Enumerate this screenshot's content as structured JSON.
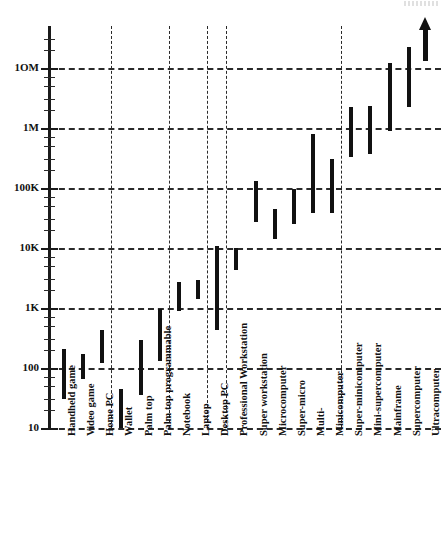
{
  "chart_data": {
    "type": "bar",
    "chart_style": "floating range bars (high-low) on logarithmic scale",
    "title": "",
    "subtitle": "",
    "xlabel": "",
    "ylabel": "",
    "grid": true,
    "legend": null,
    "y_axis": {
      "scale": "log10",
      "tick_labels": [
        "10",
        "100",
        "1K",
        "10K",
        "100K",
        "1M",
        "1OM"
      ],
      "tick_values": [
        10,
        100,
        1000,
        10000,
        100000,
        1000000,
        10000000
      ],
      "ylim": [
        10,
        30000000
      ],
      "minor_ticks_per_decade": 4
    },
    "x_axis": {
      "vertical_gridline_after": [
        "Home PC",
        "Palm top programmable",
        "Laptop",
        "Desktop PC",
        "Minicomputer"
      ]
    },
    "categories": [
      "Handheld game",
      "Video game",
      "Home PC",
      "Wallet",
      "Palm top",
      "Palm top programmable",
      "Notebook",
      "Laptop",
      "Desktop PC",
      "Professional Workstation",
      "Super workstation",
      "Microcomputer",
      "Super-micro",
      "Multi-",
      "Minicomputer",
      "Super-minicomputer",
      "Mini-supercomputer",
      "Mainframe",
      "Supercomputer",
      "Ultracomputer"
    ],
    "bars_low": [
      30,
      65,
      120,
      10,
      35,
      130,
      900,
      1400,
      430,
      4300,
      27000,
      14000,
      25000,
      38000,
      38000,
      330000,
      370000,
      900000,
      2200000
    ],
    "bars_high": [
      210,
      170,
      430,
      45,
      290,
      950,
      2700,
      2900,
      11000,
      10000,
      130000,
      45000,
      95000,
      800000,
      300000,
      2200000,
      2300000,
      12000000,
      22000000
    ],
    "series": [
      {
        "name": "Handheld game",
        "low": 30,
        "high": 210
      },
      {
        "name": "Video game",
        "low": 65,
        "high": 170
      },
      {
        "name": "Home PC",
        "low": 120,
        "high": 430
      },
      {
        "name": "Wallet",
        "low": 10,
        "high": 45
      },
      {
        "name": "Palm top",
        "low": 35,
        "high": 290
      },
      {
        "name": "Palm top programmable",
        "low": 130,
        "high": 950
      },
      {
        "name": "Notebook",
        "low": 900,
        "high": 2700
      },
      {
        "name": "Laptop",
        "low": 1400,
        "high": 2900
      },
      {
        "name": "Desktop PC",
        "low": 430,
        "high": 11000
      },
      {
        "name": "Professional Workstation",
        "low": 4300,
        "high": 10000
      },
      {
        "name": "Super workstation",
        "low": 27000,
        "high": 130000
      },
      {
        "name": "Microcomputer",
        "low": 14000,
        "high": 45000
      },
      {
        "name": "Super-micro",
        "low": 25000,
        "high": 95000
      },
      {
        "name": "Multi-",
        "low": 38000,
        "high": 800000
      },
      {
        "name": "Minicomputer",
        "low": 38000,
        "high": 300000
      },
      {
        "name": "Super-minicomputer",
        "low": 330000,
        "high": 2200000
      },
      {
        "name": "Mini-supercomputer",
        "low": 370000,
        "high": 2300000
      },
      {
        "name": "Mainframe",
        "low": 900000,
        "high": 12000000
      },
      {
        "name": "Supercomputer",
        "low": 2200000,
        "high": 22000000
      },
      {
        "name": "Ultracomputer",
        "low": null,
        "high": null,
        "note": "represented by upward arrow (open-ended, beyond chart top)"
      }
    ],
    "annotations": [
      {
        "name": "up-arrow",
        "description": "upward arrow above Ultracomputer indicating unbounded growth"
      }
    ]
  },
  "axis": {
    "labels": [
      {
        "text": "1OM",
        "value": 10000000
      },
      {
        "text": "1M",
        "value": 1000000
      },
      {
        "text": "100K",
        "value": 100000
      },
      {
        "text": "10K",
        "value": 10000
      },
      {
        "text": "1K",
        "value": 1000
      },
      {
        "text": "100",
        "value": 100
      },
      {
        "text": "10",
        "value": 10
      }
    ]
  },
  "colors": {
    "bar": "#111111",
    "axis": "#1a1a1a",
    "grid": "#2a2a2a",
    "background": "#ffffff"
  }
}
